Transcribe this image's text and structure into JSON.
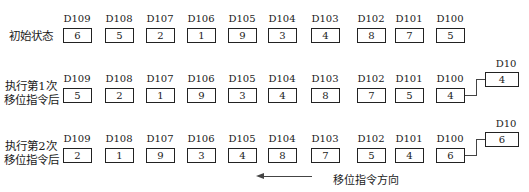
{
  "registers": [
    "D109",
    "D108",
    "D107",
    "D106",
    "D105",
    "D104",
    "D103",
    "D102",
    "D101",
    "D100"
  ],
  "output_register": "D10",
  "rows": [
    {
      "label_line1": "初始状态",
      "label_line2": "",
      "values": [
        "6",
        "5",
        "2",
        "1",
        "9",
        "3",
        "4",
        "8",
        "7",
        "5"
      ],
      "d10": null
    },
    {
      "label_line1": "执行第1次",
      "label_line2": "移位指令后",
      "values": [
        "5",
        "2",
        "1",
        "9",
        "3",
        "4",
        "8",
        "7",
        "5",
        "4"
      ],
      "d10": "4"
    },
    {
      "label_line1": "执行第2次",
      "label_line2": "移位指令后",
      "values": [
        "2",
        "1",
        "9",
        "3",
        "4",
        "8",
        "7",
        "5",
        "4",
        "6"
      ],
      "d10": "6"
    }
  ],
  "direction_label": "移位指令方向"
}
